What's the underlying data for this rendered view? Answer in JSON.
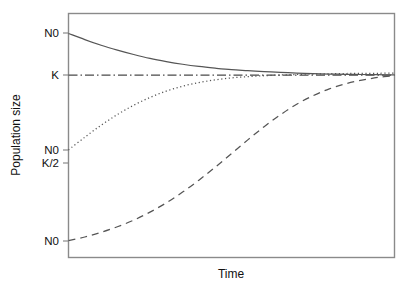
{
  "chart_data": {
    "type": "line",
    "title": "",
    "xlabel": "Time",
    "ylabel": "Population size",
    "grid": false,
    "legend": "none",
    "xlim": [
      0,
      100
    ],
    "ylim": [
      0,
      100
    ],
    "x_tick_labels": [],
    "y_tick_labels": [
      "N0",
      "K",
      "N0",
      "K/2",
      "N0"
    ],
    "y_tick_values": [
      91.8,
      74.7,
      44.1,
      38.8,
      6.9
    ],
    "annotations": [
      {
        "label": "N0",
        "meaning": "initial population size above carrying capacity",
        "y": 91.8
      },
      {
        "label": "K",
        "meaning": "carrying capacity",
        "y": 74.7
      },
      {
        "label": "N0",
        "meaning": "initial population size just above K/2",
        "y": 44.1
      },
      {
        "label": "K/2",
        "meaning": "half carrying capacity",
        "y": 38.8
      },
      {
        "label": "N0",
        "meaning": "initial population size well below K/2",
        "y": 6.9
      }
    ],
    "reference_lines": [
      {
        "name": "carrying-capacity",
        "label": "K",
        "orientation": "horizontal",
        "y": 74.7,
        "style": "dash-dot"
      }
    ],
    "series": [
      {
        "name": "decline-to-K",
        "style": "solid",
        "start_label": "N0",
        "description": "Population starting above carrying capacity declines asymptotically to K",
        "x": [
          0,
          5,
          10,
          15,
          20,
          25,
          30,
          35,
          40,
          45,
          50,
          55,
          60,
          65,
          70,
          75,
          80,
          85,
          90,
          95,
          100
        ],
        "y": [
          91.8,
          89.3,
          87.0,
          85.0,
          83.2,
          81.6,
          80.3,
          79.2,
          78.3,
          77.6,
          77.0,
          76.6,
          76.2,
          75.9,
          75.6,
          75.4,
          75.2,
          75.1,
          75.0,
          74.9,
          74.8
        ]
      },
      {
        "name": "logistic-from-near-K-half",
        "style": "dotted",
        "start_label": "N0",
        "description": "Logistic growth starting just above K/2, rising quickly to K",
        "x": [
          0,
          5,
          10,
          15,
          20,
          25,
          30,
          35,
          40,
          45,
          50,
          55,
          60,
          65,
          70,
          75,
          80,
          85,
          90,
          95,
          100
        ],
        "y": [
          44.1,
          49.3,
          54.2,
          58.6,
          62.4,
          65.6,
          68.2,
          70.2,
          71.7,
          72.8,
          73.6,
          74.1,
          74.5,
          74.8,
          75.0,
          75.2,
          75.3,
          75.4,
          75.5,
          75.5,
          75.6
        ]
      },
      {
        "name": "logistic-from-low-N0",
        "style": "dashed",
        "start_label": "N0",
        "description": "Logistic S-shaped growth from a low starting size through K/2 toward K",
        "x": [
          0,
          5,
          10,
          15,
          20,
          25,
          30,
          35,
          40,
          45,
          50,
          55,
          60,
          65,
          70,
          75,
          80,
          85,
          90,
          95,
          100
        ],
        "y": [
          6.9,
          8.4,
          10.3,
          12.6,
          15.3,
          18.6,
          22.4,
          26.8,
          31.7,
          37.0,
          42.6,
          48.2,
          53.6,
          58.5,
          62.8,
          66.3,
          69.1,
          71.2,
          72.7,
          73.8,
          74.5
        ]
      }
    ]
  },
  "axes": {
    "y_title": "Population size",
    "x_title": "Time"
  }
}
